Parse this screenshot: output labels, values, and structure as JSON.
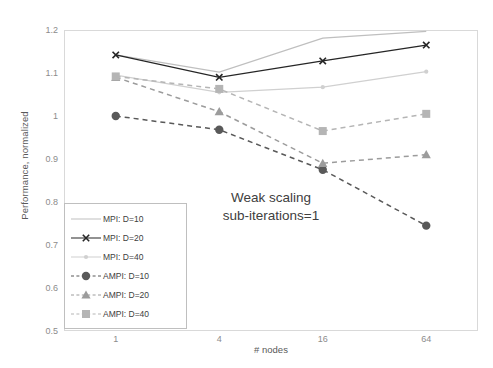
{
  "chart_data": {
    "type": "line",
    "title": "",
    "xlabel": "# nodes",
    "ylabel": "Performance, normalized",
    "categories": [
      "1",
      "4",
      "16",
      "64"
    ],
    "ylim": [
      0.5,
      1.2
    ],
    "ytick_labels": [
      "1.2",
      "1.1",
      "1",
      "0.9",
      "0.8",
      "0.7",
      "0.6",
      "0.5"
    ],
    "ytick_values": [
      1.2,
      1.1,
      1.0,
      0.9,
      0.8,
      0.7,
      0.6,
      0.5
    ],
    "grid": false,
    "legend_position": "inside-lower-left",
    "annotations": [
      {
        "text": "Weak scaling"
      },
      {
        "text": "sub-iterations=1"
      }
    ],
    "series": [
      {
        "name": "MPI: D=10",
        "values": [
          1.142,
          1.102,
          1.181,
          1.197
        ],
        "color": "#bfbfbf",
        "style": "solid",
        "marker": "none"
      },
      {
        "name": "MPI: D=20",
        "values": [
          1.142,
          1.09,
          1.128,
          1.165
        ],
        "color": "#262626",
        "style": "solid",
        "marker": "x"
      },
      {
        "name": "MPI: D=40",
        "values": [
          1.095,
          1.055,
          1.067,
          1.103
        ],
        "color": "#d0d0d0",
        "style": "solid",
        "marker": "dot"
      },
      {
        "name": "AMPI: D=10",
        "values": [
          1.0,
          0.968,
          0.875,
          0.745
        ],
        "color": "#595959",
        "style": "dashed",
        "marker": "circle"
      },
      {
        "name": "AMPI: D=20",
        "values": [
          1.09,
          1.01,
          0.89,
          0.91
        ],
        "color": "#9c9c9c",
        "style": "dashed",
        "marker": "triangle"
      },
      {
        "name": "AMPI: D=40",
        "values": [
          1.092,
          1.063,
          0.965,
          1.005
        ],
        "color": "#b5b5b5",
        "style": "dashed",
        "marker": "square"
      }
    ]
  }
}
